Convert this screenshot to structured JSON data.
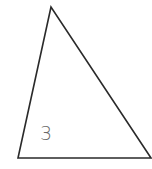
{
  "diagram": {
    "type": "triangle",
    "vertices": [
      [
        51,
        7
      ],
      [
        18,
        158
      ],
      [
        151,
        158
      ]
    ],
    "stroke_color": "#2a2a2a",
    "stroke_width": 1.6,
    "label": "3",
    "label_color": "#6a6a6a"
  }
}
